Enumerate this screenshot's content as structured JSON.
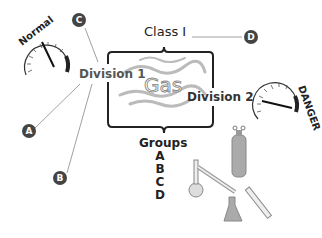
{
  "diagram": {
    "central": {
      "title": "Class I",
      "substance": "Gas",
      "divisions": [
        "Division 1",
        "Division 2"
      ],
      "groups_label": "Groups",
      "groups": [
        "A",
        "B",
        "C",
        "D"
      ]
    },
    "gauges": {
      "normal": {
        "label": "Normal"
      },
      "danger": {
        "label": "DANGER"
      }
    },
    "callouts": {
      "A": "A",
      "B": "B",
      "C": "C",
      "D": "D"
    },
    "illustrations": [
      "gas-cylinder",
      "distillation-flask",
      "condenser",
      "erlenmeyer-flask",
      "graduated-cylinder"
    ],
    "colors": {
      "line": "#777777",
      "badge": "#444444",
      "gas_wisps": "#bbbbbb",
      "lab_glass": "#aaaaaa"
    }
  }
}
